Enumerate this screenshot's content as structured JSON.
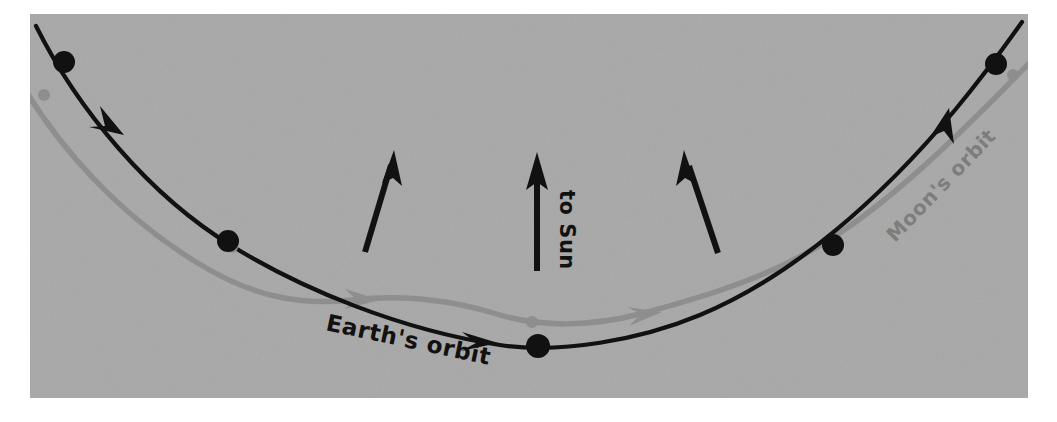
{
  "figure": {
    "panel": {
      "background_color": "#a8a8a8",
      "page_color": "#ffffff",
      "x": 30,
      "y": 14,
      "width": 998,
      "height": 384
    },
    "labels": {
      "earth_orbit": "Earth's orbit",
      "moon_orbit": "Moon's orbit",
      "to_sun": "to Sun"
    },
    "colors": {
      "earth_curve": "#111111",
      "moon_curve": "#8e8e8e",
      "earth_body": "#111111",
      "moon_body": "#8e8e8e",
      "arrow": "#111111",
      "earth_label": "#111111",
      "moon_label": "#7d7d7d"
    },
    "earth_positions": [
      {
        "name": "earth-body-1",
        "cx": 64,
        "cy": 62,
        "r": 11
      },
      {
        "name": "earth-body-2",
        "cx": 228,
        "cy": 241,
        "r": 11
      },
      {
        "name": "earth-body-3",
        "cx": 538,
        "cy": 346,
        "r": 12
      },
      {
        "name": "earth-body-4",
        "cx": 833,
        "cy": 245,
        "r": 11
      },
      {
        "name": "earth-body-5",
        "cx": 996,
        "cy": 64,
        "r": 11
      }
    ],
    "moon_positions": [
      {
        "name": "moon-body-1",
        "cx": 44,
        "cy": 95,
        "r": 6
      },
      {
        "name": "moon-body-2",
        "cx": 232,
        "cy": 247,
        "r": 6
      },
      {
        "name": "moon-body-3",
        "cx": 532,
        "cy": 322,
        "r": 6
      },
      {
        "name": "moon-body-4",
        "cx": 836,
        "cy": 240,
        "r": 6
      },
      {
        "name": "moon-body-5",
        "cx": 1013,
        "cy": 75,
        "r": 6
      }
    ],
    "sun_arrows": [
      {
        "name": "sun-arrow-left",
        "x1": 365,
        "y1": 252,
        "x2": 394,
        "y2": 152
      },
      {
        "name": "sun-arrow-center",
        "x1": 537,
        "y1": 270,
        "x2": 537,
        "y2": 155
      },
      {
        "name": "sun-arrow-right",
        "x1": 718,
        "y1": 253,
        "x2": 684,
        "y2": 152
      }
    ],
    "earth_orbit_arrowheads": [
      {
        "name": "earth-orbit-arrowhead-1"
      },
      {
        "name": "earth-orbit-arrowhead-2"
      },
      {
        "name": "earth-orbit-arrowhead-3"
      }
    ],
    "moon_orbit_arrowheads": [
      {
        "name": "moon-orbit-arrowhead-1"
      },
      {
        "name": "moon-orbit-arrowhead-2"
      }
    ]
  }
}
